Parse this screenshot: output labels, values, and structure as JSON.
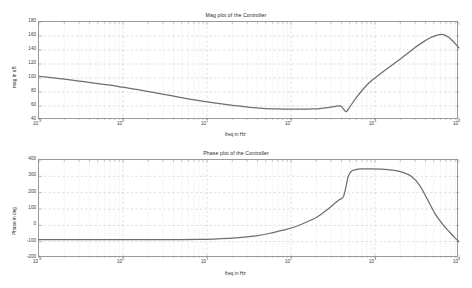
{
  "figure": {
    "background": "#ffffff",
    "curve_color": "#6e6e6e",
    "grid_color": "#b9b9b9",
    "axis_color": "#9a9a9a"
  },
  "panels": [
    {
      "id": "mag",
      "title": "Mag plot of the Controller",
      "xlabel": "freq in Hz",
      "ylabel": "mag in dB"
    },
    {
      "id": "phase",
      "title": "Phase plot of the Controller",
      "xlabel": "freq in Hz",
      "ylabel": "Phase in deg"
    }
  ],
  "chart_data": [
    {
      "type": "line",
      "title": "Mag plot of the Controller",
      "xlabel": "freq in Hz",
      "ylabel": "mag in dB",
      "xscale": "log",
      "xlim": [
        0.1,
        10000
      ],
      "ylim": [
        40,
        180
      ],
      "xticks": [
        "10-1",
        "100",
        "101",
        "102",
        "103",
        "104"
      ],
      "xtick_labels": [
        "10",
        "10",
        "10",
        "10",
        "10",
        "10"
      ],
      "xtick_exponents": [
        "-1",
        "0",
        "1",
        "2",
        "3",
        "4"
      ],
      "yticks": [
        40,
        60,
        80,
        100,
        120,
        140,
        160,
        180
      ],
      "grid": true,
      "legend": "none",
      "series": [
        {
          "name": "magnitude",
          "x": [
            0.1,
            0.14,
            0.2,
            0.3,
            0.45,
            0.7,
            1.0,
            1.5,
            2.2,
            3.2,
            4.6,
            6.8,
            10,
            15,
            22,
            32,
            46,
            68,
            100,
            140,
            180,
            220,
            260,
            300,
            340,
            380,
            400,
            420,
            440,
            460,
            500,
            600,
            800,
            1100,
            1600,
            2200,
            3000,
            3800,
            4600,
            5500,
            6500,
            7600,
            8800,
            10000
          ],
          "y": [
            102.5,
            100.5,
            98.3,
            95.6,
            92.8,
            89.8,
            86.8,
            83.4,
            79.9,
            76.3,
            72.7,
            69.0,
            66.0,
            63.0,
            60.4,
            58.2,
            56.7,
            55.9,
            55.5,
            55.6,
            55.9,
            56.4,
            57.2,
            58.3,
            59.6,
            60.3,
            59.3,
            56.0,
            52.8,
            52.2,
            58.5,
            72.0,
            90.0,
            104.0,
            118.5,
            131.0,
            143.5,
            152.0,
            157.8,
            161.4,
            162.0,
            158.0,
            150.5,
            143.0
          ]
        }
      ]
    },
    {
      "type": "line",
      "title": "Phase plot of the Controller",
      "xlabel": "freq in Hz",
      "ylabel": "Phase in deg",
      "xscale": "log",
      "xlim": [
        0.1,
        10000
      ],
      "ylim": [
        -200,
        400
      ],
      "xticks": [
        "10-1",
        "100",
        "101",
        "102",
        "103",
        "104"
      ],
      "xtick_labels": [
        "10",
        "10",
        "10",
        "10",
        "10",
        "10"
      ],
      "xtick_exponents": [
        "-1",
        "0",
        "1",
        "2",
        "3",
        "4"
      ],
      "yticks": [
        -200,
        -100,
        0,
        100,
        200,
        300,
        400
      ],
      "grid": true,
      "legend": "none",
      "series": [
        {
          "name": "phase",
          "x": [
            0.1,
            0.2,
            0.4,
            0.8,
            1.5,
            3.0,
            5.0,
            8.0,
            12,
            18,
            26,
            38,
            55,
            80,
            110,
            150,
            200,
            260,
            320,
            380,
            420,
            450,
            480,
            520,
            580,
            700,
            900,
            1200,
            1600,
            2100,
            2700,
            3400,
            4200,
            5200,
            6400,
            7800,
            9000,
            10000
          ],
          "y": [
            -88,
            -88,
            -88,
            -88,
            -88,
            -87.5,
            -87,
            -86,
            -84,
            -80,
            -74,
            -64,
            -50,
            -30,
            -10,
            18,
            48,
            90,
            128,
            158,
            175,
            232,
            300,
            330,
            340,
            345,
            346,
            344,
            338,
            326,
            300,
            245,
            160,
            70,
            6,
            -44,
            -78,
            -100
          ]
        }
      ]
    }
  ]
}
